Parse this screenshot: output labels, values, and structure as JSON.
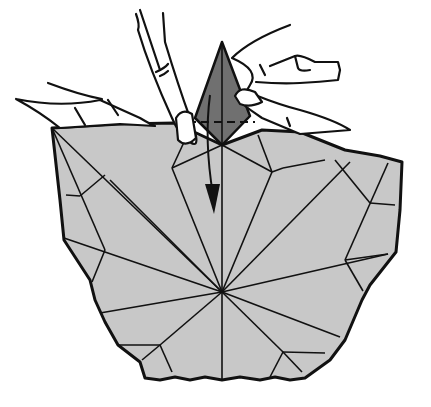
{
  "diagram": {
    "type": "origami-instruction-step",
    "caption": "",
    "colors": {
      "background": "#ffffff",
      "paper_fill": "#c8c8c8",
      "flap_fill": "#707070",
      "line": "#111111",
      "hand_fill": "#ffffff"
    },
    "elements": [
      {
        "name": "paper-base",
        "description": "light gray folded paper with crease lines radiating from a central point"
      },
      {
        "name": "dark-flap",
        "description": "dark gray kite-shaped point held upright between two hands"
      },
      {
        "name": "valley-fold-line",
        "description": "dashed horizontal fold line across the dark flap"
      },
      {
        "name": "fold-down-arrow",
        "description": "arrow pointing down indicating the flap is folded down"
      },
      {
        "name": "left-hand",
        "description": "left hand holding the paper edge"
      },
      {
        "name": "right-hand",
        "description": "right hand pinching the flap"
      }
    ]
  }
}
